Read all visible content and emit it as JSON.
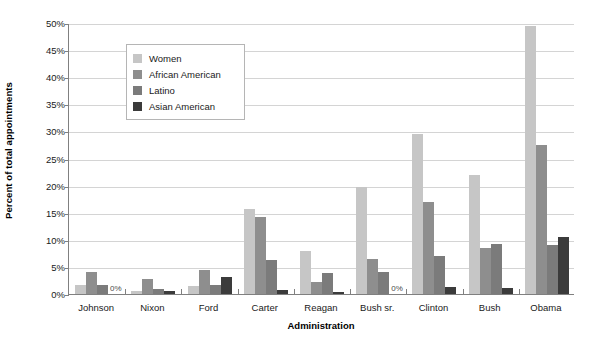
{
  "chart_data": {
    "type": "bar",
    "title": "",
    "xlabel": "Administration",
    "ylabel": "Percent of total appointments",
    "categories": [
      "Johnson",
      "Nixon",
      "Ford",
      "Carter",
      "Reagan",
      "Bush sr.",
      "Clinton",
      "Bush",
      "Obama"
    ],
    "series": [
      {
        "name": "Women",
        "color": "#c6c6c6",
        "values": [
          1.6,
          0.6,
          1.5,
          15.7,
          8.0,
          19.7,
          29.5,
          22.0,
          49.5
        ]
      },
      {
        "name": "African American",
        "color": "#8e8e8e",
        "values": [
          4.0,
          2.7,
          4.5,
          14.3,
          2.2,
          6.5,
          16.9,
          8.5,
          27.5
        ]
      },
      {
        "name": "Latino",
        "color": "#7b7b7b",
        "values": [
          1.7,
          1.0,
          1.7,
          6.2,
          3.9,
          4.0,
          7.0,
          9.3,
          9.0
        ]
      },
      {
        "name": "Asian American",
        "color": "#3b3b3b",
        "values": [
          0.0,
          0.5,
          3.2,
          0.8,
          0.4,
          0.0,
          1.3,
          1.1,
          10.5
        ]
      }
    ],
    "ylim": [
      0,
      50
    ],
    "yticks": [
      "0%",
      "5%",
      "10%",
      "15%",
      "20%",
      "25%",
      "30%",
      "35%",
      "40%",
      "45%",
      "50%"
    ],
    "ytick_values": [
      0,
      5,
      10,
      15,
      20,
      25,
      30,
      35,
      40,
      45,
      50
    ],
    "grid": true,
    "legend_position": "upper-left-inside",
    "annotations": [
      {
        "text": "0%",
        "category": "Johnson",
        "series": "Asian American"
      },
      {
        "text": "0%",
        "category": "Bush sr.",
        "series": "Asian American"
      }
    ]
  },
  "legend": {
    "items": [
      {
        "label": "Women"
      },
      {
        "label": "African American"
      },
      {
        "label": "Latino"
      },
      {
        "label": "Asian American"
      }
    ]
  },
  "axes": {
    "y_title": "Percent of total appointments",
    "x_title": "Administration"
  }
}
